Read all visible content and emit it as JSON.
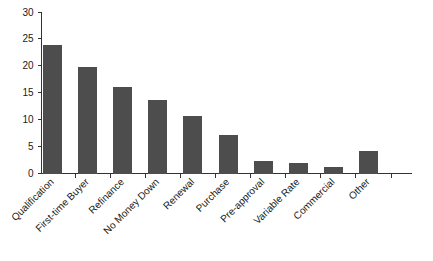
{
  "chart_data": {
    "type": "bar",
    "title": "",
    "subtitle": "",
    "xlabel": "",
    "ylabel": "",
    "categories": [
      "Qualification",
      "First-time Buyer",
      "Refinance",
      "No Money Down",
      "Renewal",
      "Purchase",
      "Pre-approval",
      "Variable Rate",
      "Commercial",
      "Other"
    ],
    "values": [
      23.9,
      19.8,
      16.0,
      13.6,
      10.6,
      7.2,
      2.3,
      1.9,
      1.2,
      4.2
    ],
    "ylim": [
      0,
      30
    ],
    "yticks": [
      0,
      5,
      10,
      15,
      20,
      25,
      30
    ],
    "ytick_labels": [
      "0",
      "5",
      "10",
      "15",
      "20",
      "25",
      "30"
    ],
    "grid": false,
    "legend": false,
    "legend_position": "none",
    "bar_color": "#4d4d4d",
    "axis_color": "#333333",
    "background_color": "#ffffff",
    "xtick_label_rotation": 45
  }
}
